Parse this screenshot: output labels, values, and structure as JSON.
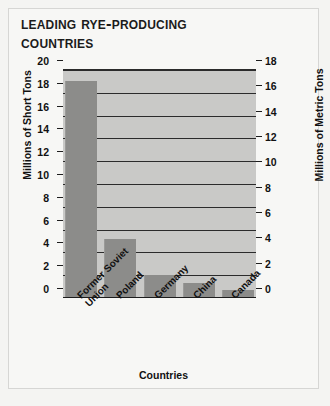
{
  "chart_data": {
    "type": "bar",
    "xlabel": "Countries",
    "ylabel": "Millions of Short Tons",
    "ylabel_secondary": "Millions of Metric Tons",
    "categories": [
      "Former Soviet Union",
      "Poland",
      "Germany",
      "China",
      "Canada"
    ],
    "category_lines": [
      [
        "Former Soviet",
        "Union"
      ],
      [
        "Poland"
      ],
      [
        "Germany"
      ],
      [
        "China"
      ],
      [
        "Canada"
      ]
    ],
    "values": [
      19.0,
      5.2,
      2.0,
      1.3,
      0.7
    ],
    "values_metric_tons": [
      17.2,
      4.7,
      1.8,
      1.2,
      0.6
    ],
    "ylim": [
      0,
      20
    ],
    "ylim_secondary": [
      0,
      18
    ],
    "yticks": [
      0,
      2,
      4,
      6,
      8,
      10,
      12,
      14,
      16,
      18,
      20
    ],
    "yticks_secondary": [
      0,
      2,
      4,
      6,
      8,
      10,
      12,
      14,
      16,
      18
    ],
    "grid": true,
    "legend": "none",
    "bar_color": "#8c8c8a",
    "plot_background": "#c9c9c7",
    "axis_color": "#1d1d1d"
  },
  "ticks_left": [
    {
      "label": "20",
      "value": 20
    },
    {
      "label": "18",
      "value": 18
    },
    {
      "label": "16",
      "value": 16
    },
    {
      "label": "14",
      "value": 14
    },
    {
      "label": "12",
      "value": 12
    },
    {
      "label": "10",
      "value": 10
    },
    {
      "label": "8",
      "value": 8
    },
    {
      "label": "6",
      "value": 6
    },
    {
      "label": "4",
      "value": 4
    },
    {
      "label": "2",
      "value": 2
    },
    {
      "label": "0",
      "value": 0
    }
  ],
  "ticks_right": [
    {
      "label": "18",
      "value": 18
    },
    {
      "label": "16",
      "value": 16
    },
    {
      "label": "14",
      "value": 14
    },
    {
      "label": "12",
      "value": 12
    },
    {
      "label": "10",
      "value": 10
    },
    {
      "label": "8",
      "value": 8
    },
    {
      "label": "6",
      "value": 6
    },
    {
      "label": "4",
      "value": 4
    },
    {
      "label": "2",
      "value": 2
    },
    {
      "label": "0",
      "value": 0
    }
  ],
  "title_lines": [
    "Leading Rye-Producing",
    "Countries"
  ]
}
